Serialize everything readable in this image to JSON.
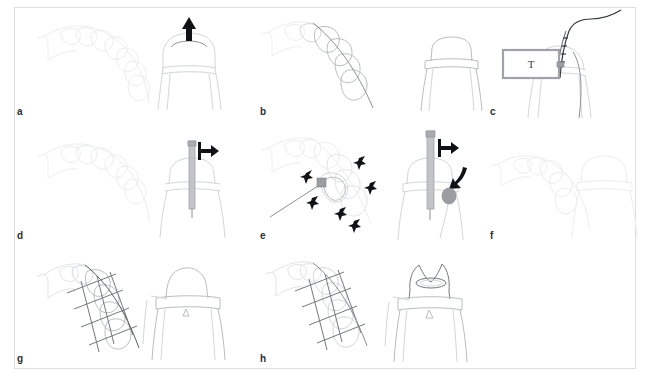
{
  "figure": {
    "width": 650,
    "height": 377,
    "background": "#ffffff",
    "border_color": "#dedede",
    "rows": 3,
    "columns": 3
  },
  "colors": {
    "arrow_black": "#111214",
    "outline_faint": "#e2e3e5",
    "outline_light": "#d3d5d8",
    "outline_mid": "#b9bcc0",
    "outline_dark": "#75787c",
    "rod_gray": "#c2c4c7",
    "box_border": "#9fa2a6",
    "label_text": "#2f2f2f"
  },
  "panels": [
    {
      "id": "a",
      "label": "a",
      "description": "Occlusal arch view with faint tooth outlines at left and a buccal tooth view at right with an upward arrow above a curved arc",
      "arrows": [
        {
          "name": "up-arrow",
          "direction": "up"
        }
      ],
      "annotations": []
    },
    {
      "id": "b",
      "label": "b",
      "description": "Occlusal arch with four highlighted teeth and a through line; buccal view shows a prepared tooth with a horizontal margin band",
      "arrows": [],
      "annotations": []
    },
    {
      "id": "c",
      "label": "c",
      "description": "Rectangular box labelled T connected by a probe wire that runs up and over to the right; buccal tooth view behind",
      "arrows": [],
      "annotations": [
        {
          "name": "t-box-label",
          "text": "T"
        }
      ]
    },
    {
      "id": "d",
      "label": "d",
      "description": "Faint occlusal arch; buccal view with a vertical cylindrical rod inserted through the tooth and a rightward arrow at its top",
      "arrows": [
        {
          "name": "right-arrow",
          "direction": "right"
        }
      ],
      "annotations": []
    },
    {
      "id": "e",
      "label": "e",
      "description": "Occlusal view with a probe tip on a tooth surrounded by six small black arrows pointing inward; buccal view with rod, rightward arrow, curved arrow and gray blob",
      "arrows": [
        {
          "name": "radial-arrow-1",
          "direction": "up"
        },
        {
          "name": "radial-arrow-2",
          "direction": "up-right"
        },
        {
          "name": "radial-arrow-3",
          "direction": "right"
        },
        {
          "name": "radial-arrow-4",
          "direction": "down"
        },
        {
          "name": "radial-arrow-5",
          "direction": "down-right"
        },
        {
          "name": "radial-arrow-6",
          "direction": "down-left"
        },
        {
          "name": "right-arrow",
          "direction": "right"
        },
        {
          "name": "curved-arrow",
          "direction": "down"
        }
      ],
      "annotations": []
    },
    {
      "id": "f",
      "label": "f",
      "description": "Very faint occlusal arch and buccal view of the finished prepared tooth with margin band, no instruments",
      "arrows": [],
      "annotations": []
    },
    {
      "id": "g",
      "label": "g",
      "description": "Occlusal arch with crossing measurement lines through four teeth; buccal view of seated crown with margin band",
      "arrows": [],
      "annotations": []
    },
    {
      "id": "h",
      "label": "h",
      "description": "Occlusal arch with crossing lines; buccal view of the crown with an oval access opening on the occlusal surface",
      "arrows": [],
      "annotations": []
    }
  ]
}
